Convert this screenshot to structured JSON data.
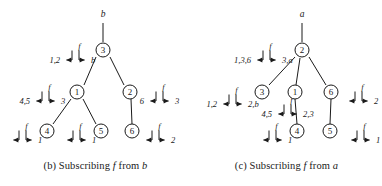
{
  "figure": {
    "panels": [
      {
        "id": "b",
        "caption_prefix": "(b) Subscribing ",
        "caption_italic": "f",
        "caption_suffix": " from ",
        "caption_italic2": "b",
        "root_label": "b",
        "nodes": [
          {
            "name": "node-3",
            "label": "3",
            "cx": 103,
            "cy": 50
          },
          {
            "name": "node-1",
            "label": "1",
            "cx": 77,
            "cy": 92
          },
          {
            "name": "node-2",
            "label": "2",
            "cx": 130,
            "cy": 92
          },
          {
            "name": "node-4",
            "label": "4",
            "cx": 47,
            "cy": 131
          },
          {
            "name": "node-5",
            "label": "5",
            "cx": 101,
            "cy": 131
          },
          {
            "name": "node-6",
            "label": "6",
            "cx": 132,
            "cy": 131
          }
        ],
        "edges": [
          {
            "name": "edge-root-3",
            "x1": 103,
            "y1": 23,
            "x2": 103,
            "y2": 42
          },
          {
            "name": "edge-3-1",
            "x1": 96,
            "y1": 57,
            "x2": 84,
            "y2": 85
          },
          {
            "name": "edge-3-2",
            "x1": 110,
            "y1": 57,
            "x2": 124,
            "y2": 85
          },
          {
            "name": "edge-1-4",
            "x1": 71,
            "y1": 99,
            "x2": 53,
            "y2": 124
          },
          {
            "name": "edge-1-5",
            "x1": 83,
            "y1": 99,
            "x2": 96,
            "y2": 124
          },
          {
            "name": "edge-2-6",
            "x1": 131,
            "y1": 99,
            "x2": 132,
            "y2": 124
          }
        ],
        "annotations": [
          {
            "name": "annotation-node-3",
            "f": "f",
            "left_value": "1,2",
            "right_value": "b",
            "hx": 72,
            "hy": 60
          },
          {
            "name": "annotation-node-1",
            "f": "f",
            "left_value": "4,5",
            "right_value": "3",
            "hx": 42,
            "hy": 101
          },
          {
            "name": "annotation-node-2",
            "f": "f",
            "left_value": "6",
            "right_value": "3",
            "hx": 156,
            "hy": 101
          },
          {
            "name": "annotation-node-4",
            "f": "f",
            "left_value": "",
            "right_value": "1",
            "hx": 19,
            "hy": 140
          },
          {
            "name": "annotation-node-5",
            "f": "f",
            "left_value": "",
            "right_value": "1",
            "hx": 73,
            "hy": 140
          },
          {
            "name": "annotation-node-6",
            "f": "f",
            "left_value": "",
            "right_value": "2",
            "hx": 152,
            "hy": 140
          }
        ]
      },
      {
        "id": "c",
        "caption_prefix": "(c) Subscribing ",
        "caption_italic": "f",
        "caption_suffix": " from ",
        "caption_italic2": "a",
        "root_label": "a",
        "nodes": [
          {
            "name": "node-2",
            "label": "2",
            "cx": 111,
            "cy": 50
          },
          {
            "name": "node-3",
            "label": "3",
            "cx": 71,
            "cy": 92
          },
          {
            "name": "node-1",
            "label": "1",
            "cx": 104,
            "cy": 92
          },
          {
            "name": "node-6",
            "label": "6",
            "cx": 140,
            "cy": 92
          },
          {
            "name": "node-4",
            "label": "4",
            "cx": 106,
            "cy": 131
          },
          {
            "name": "node-5",
            "label": "5",
            "cx": 139,
            "cy": 131
          }
        ],
        "edges": [
          {
            "name": "edge-root-2",
            "x1": 111,
            "y1": 23,
            "x2": 111,
            "y2": 42
          },
          {
            "name": "edge-2-3",
            "x1": 104,
            "y1": 57,
            "x2": 78,
            "y2": 85
          },
          {
            "name": "edge-2-1",
            "x1": 109,
            "y1": 58,
            "x2": 105,
            "y2": 85
          },
          {
            "name": "edge-2-6",
            "x1": 118,
            "y1": 57,
            "x2": 135,
            "y2": 85
          },
          {
            "name": "edge-1-4",
            "x1": 104,
            "y1": 99,
            "x2": 106,
            "y2": 124
          },
          {
            "name": "edge-6-5",
            "x1": 140,
            "y1": 99,
            "x2": 139,
            "y2": 124
          }
        ],
        "annotations": [
          {
            "name": "annotation-node-2",
            "f": "f",
            "left_value": "1,3,6",
            "right_value": "3,a",
            "hx": 72,
            "hy": 60
          },
          {
            "name": "annotation-node-3",
            "f": "f",
            "left_value": "1,2",
            "right_value": "2,b",
            "hx": 38,
            "hy": 104
          },
          {
            "name": "annotation-node-1",
            "f": "f",
            "left_value": "4,5",
            "right_value": "2,3",
            "hx": 93,
            "hy": 114
          },
          {
            "name": "annotation-node-6",
            "f": "f",
            "left_value": "",
            "right_value": "2",
            "hx": 164,
            "hy": 101
          },
          {
            "name": "annotation-node-4",
            "f": "f",
            "left_value": "",
            "right_value": "1",
            "hx": 78,
            "hy": 140
          },
          {
            "name": "annotation-node-5",
            "f": "f",
            "left_value": "",
            "right_value": "1",
            "hx": 166,
            "hy": 140
          }
        ]
      }
    ]
  }
}
